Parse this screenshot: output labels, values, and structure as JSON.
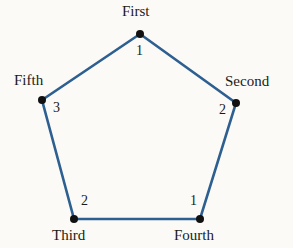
{
  "diagram": {
    "type": "pentagon-graph",
    "edge_color": "#2d5f91",
    "node_color": "#111111",
    "nodes": [
      {
        "id": "first",
        "label": "First",
        "value": "1",
        "x": 140,
        "y": 34
      },
      {
        "id": "second",
        "label": "Second",
        "value": "2",
        "x": 236,
        "y": 103
      },
      {
        "id": "fourth",
        "label": "Fourth",
        "value": "1",
        "x": 200,
        "y": 219
      },
      {
        "id": "third",
        "label": "Third",
        "value": "2",
        "x": 74,
        "y": 219
      },
      {
        "id": "fifth",
        "label": "Fifth",
        "value": "3",
        "x": 42,
        "y": 100
      }
    ],
    "edges": [
      [
        "first",
        "second"
      ],
      [
        "second",
        "fourth"
      ],
      [
        "fourth",
        "third"
      ],
      [
        "third",
        "fifth"
      ],
      [
        "fifth",
        "first"
      ]
    ]
  }
}
